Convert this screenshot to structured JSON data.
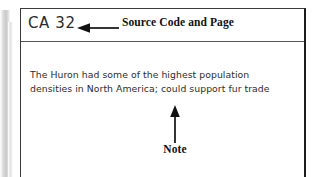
{
  "figure": {
    "source_code_label": "CA 32",
    "header_annotation": "Source Code and Page",
    "note_annotation": "Note",
    "note_lines": [
      "The Huron had some of the highest population",
      "densities in North America; could support fur trade"
    ],
    "colors": {
      "ink": "#2c2c2c",
      "annotation": "#111111",
      "border_dark": "#1c1c1c",
      "border_light": "#3a3a3a",
      "divider": "#555555",
      "page_edge": "#c9c9c9",
      "background": "#ffffff"
    },
    "icons": {
      "header_arrow": "arrow-left-icon",
      "note_arrow": "arrow-up-icon"
    }
  }
}
